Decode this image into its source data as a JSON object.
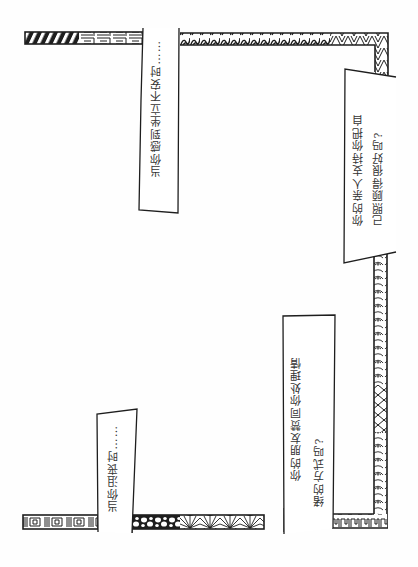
{
  "page": {
    "colors": {
      "ink": "#1e1e1e",
      "paper": "#ffffff",
      "text": "#333333"
    }
  },
  "labels": [
    {
      "id": "label-top-middle",
      "text": "当你感到坐立不安时……"
    },
    {
      "id": "label-right-top",
      "lines": [
        "你的亲人支持你把自",
        "己照顾得很好吗?"
      ]
    },
    {
      "id": "label-right-bottom",
      "lines": [
        "你的朋友赞同你处理情",
        "绪的方式吗?"
      ]
    },
    {
      "id": "label-bottom-left",
      "text": "当你沮丧时……"
    }
  ],
  "borders": [
    {
      "id": "border-top-left",
      "pattern": "diagonal-stripes-and-maze"
    },
    {
      "id": "border-top-right",
      "pattern": "waves-and-triangles"
    },
    {
      "id": "border-right",
      "pattern": "swirls-and-zigzag"
    },
    {
      "id": "border-bottom-middle",
      "pattern": "pebbles-and-fans"
    },
    {
      "id": "border-bottom-left",
      "pattern": "greek-key-squares"
    },
    {
      "id": "border-bottom-right",
      "pattern": "maze-corner"
    }
  ]
}
